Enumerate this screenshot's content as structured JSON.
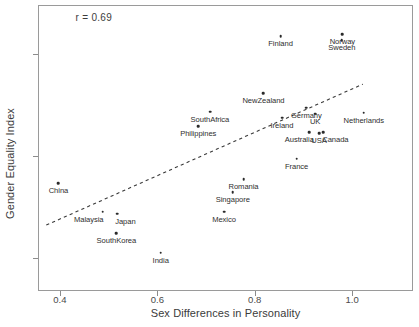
{
  "chart_data": {
    "type": "scatter",
    "title": "",
    "xlabel": "Sex Differences in Personality",
    "ylabel": "Gender Equality Index",
    "xlim": [
      0.355,
      1.125
    ],
    "ylim": [
      0.568,
      0.848
    ],
    "xticks": [
      "0.4",
      "0.6",
      "0.8",
      "1.0"
    ],
    "xtick_values": [
      0.4,
      0.6,
      0.8,
      1.0
    ],
    "yticks": [
      "0.8",
      "0.7",
      "0.6"
    ],
    "ytick_values": [
      0.8,
      0.7,
      0.6
    ],
    "grid": false,
    "legend": null,
    "annotation": "r = 0.69",
    "correlation": 0.69,
    "trendline": {
      "type": "dashed-linear",
      "x_start": 0.372,
      "y_start": 0.6325,
      "x_end": 1.022,
      "y_end": 0.7705
    },
    "point_label_format": "country",
    "points": [
      {
        "label": "China",
        "x": 0.397,
        "y": 0.6735
      },
      {
        "label": "Malaysia",
        "x": 0.488,
        "y": 0.6455
      },
      {
        "label": "Japan",
        "x": 0.518,
        "y": 0.6435
      },
      {
        "label": "SouthKorea",
        "x": 0.516,
        "y": 0.6245
      },
      {
        "label": "India",
        "x": 0.607,
        "y": 0.6055
      },
      {
        "label": "Philippines",
        "x": 0.684,
        "y": 0.7295
      },
      {
        "label": "SouthAfrica",
        "x": 0.708,
        "y": 0.7435
      },
      {
        "label": "Mexico",
        "x": 0.737,
        "y": 0.6455
      },
      {
        "label": "Singapore",
        "x": 0.755,
        "y": 0.6645
      },
      {
        "label": "Romania",
        "x": 0.777,
        "y": 0.6775
      },
      {
        "label": "NewZealand",
        "x": 0.818,
        "y": 0.7615
      },
      {
        "label": "Finland",
        "x": 0.853,
        "y": 0.8175
      },
      {
        "label": "Ireland",
        "x": 0.856,
        "y": 0.7375
      },
      {
        "label": "France",
        "x": 0.886,
        "y": 0.6975
      },
      {
        "label": "Germany",
        "x": 0.906,
        "y": 0.7475
      },
      {
        "label": "UK",
        "x": 0.924,
        "y": 0.7415
      },
      {
        "label": "Australia",
        "x": 0.912,
        "y": 0.7235
      },
      {
        "label": "USA",
        "x": 0.932,
        "y": 0.7225
      },
      {
        "label": "Canada",
        "x": 0.941,
        "y": 0.7235
      },
      {
        "label": "Sweden",
        "x": 0.979,
        "y": 0.8135
      },
      {
        "label": "Norway",
        "x": 0.98,
        "y": 0.8195
      },
      {
        "label": "Netherlands",
        "x": 1.024,
        "y": 0.7425
      }
    ],
    "label_offsets": {
      "Malaysia": -14,
      "Japan": 8,
      "Australia": -10,
      "Canada": 12,
      "USA": 0,
      "Germany": 0,
      "UK": 0
    }
  }
}
